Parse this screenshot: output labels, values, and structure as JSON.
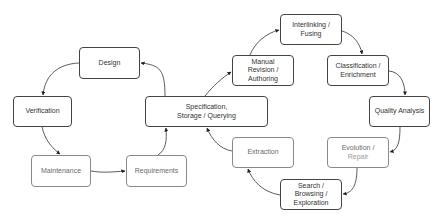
{
  "diagram": {
    "title": "",
    "colors": {
      "edge": "#333333",
      "node_border_dark": "#444444",
      "node_border_light": "#8a8a8a",
      "text_dark": "#333333",
      "text_light": "#6a6a6a",
      "text_faint": "#9a9a9a"
    },
    "nodes": [
      {
        "id": "design",
        "lines": [
          "Design"
        ],
        "style": "dark",
        "x": 79,
        "y": 47,
        "w": 61,
        "h": 32
      },
      {
        "id": "verification",
        "lines": [
          "Verification"
        ],
        "style": "dark",
        "x": 13,
        "y": 96,
        "w": 59,
        "h": 31
      },
      {
        "id": "maintenance",
        "lines": [
          "Maintenance"
        ],
        "style": "light",
        "x": 31,
        "y": 155,
        "w": 60,
        "h": 32
      },
      {
        "id": "requirements",
        "lines": [
          "Requirements"
        ],
        "style": "light",
        "x": 126,
        "y": 155,
        "w": 61,
        "h": 32
      },
      {
        "id": "specification",
        "lines": [
          "Specification,",
          "Storage / Querying"
        ],
        "style": "dark",
        "x": 145,
        "y": 96,
        "w": 123,
        "h": 31
      },
      {
        "id": "manual-revision",
        "lines": [
          "Manual",
          "Revision /",
          "Authoring"
        ],
        "style": "dark",
        "x": 232,
        "y": 55,
        "w": 62,
        "h": 31
      },
      {
        "id": "interlinking",
        "lines": [
          "Interlinking /",
          "Fusing"
        ],
        "style": "dark",
        "x": 280,
        "y": 14,
        "w": 62,
        "h": 31
      },
      {
        "id": "classification",
        "lines": [
          "Classification /",
          "Enrichment"
        ],
        "style": "dark",
        "x": 327,
        "y": 55,
        "w": 62,
        "h": 31
      },
      {
        "id": "quality-analysis",
        "lines": [
          "Quality Analysis"
        ],
        "style": "dark",
        "x": 369,
        "y": 96,
        "w": 61,
        "h": 31
      },
      {
        "id": "evolution",
        "lines": [
          "Evolution /",
          "Repair"
        ],
        "style": "light",
        "faint_lines": [
          1
        ],
        "x": 327,
        "y": 137,
        "w": 62,
        "h": 31
      },
      {
        "id": "search",
        "lines": [
          "Search /",
          "Browsing /",
          "Exploration"
        ],
        "style": "dark",
        "x": 280,
        "y": 179,
        "w": 62,
        "h": 31
      },
      {
        "id": "extraction",
        "lines": [
          "Extraction"
        ],
        "style": "light",
        "x": 232,
        "y": 137,
        "w": 62,
        "h": 31
      }
    ],
    "edges": [
      {
        "from": "specification",
        "to": "design",
        "path": "M165,96 C165,70 160,65 141,63"
      },
      {
        "from": "design",
        "to": "verification",
        "path": "M79,63 C58,64 45,75 43,95"
      },
      {
        "from": "verification",
        "to": "maintenance",
        "path": "M42,127 C45,140 52,148 60,154"
      },
      {
        "from": "maintenance",
        "to": "requirements",
        "path": "M91,171 C103,173 112,172 125,171"
      },
      {
        "from": "requirements",
        "to": "specification",
        "path": "M158,155 C166,150 167,140 166,128"
      },
      {
        "from": "specification",
        "to": "manual-revision",
        "path": "M205,96 C213,86 222,78 231,72"
      },
      {
        "from": "manual-revision",
        "to": "interlinking",
        "path": "M250,55 C255,42 267,33 279,30"
      },
      {
        "from": "interlinking",
        "to": "classification",
        "path": "M342,31 C352,34 360,42 362,54"
      },
      {
        "from": "classification",
        "to": "quality-analysis",
        "path": "M389,71 C400,72 405,82 405,95"
      },
      {
        "from": "quality-analysis",
        "to": "evolution",
        "path": "M400,127 C400,142 398,150 390,152"
      },
      {
        "from": "evolution",
        "to": "search",
        "path": "M357,168 C357,186 352,193 343,194"
      },
      {
        "from": "search",
        "to": "extraction",
        "path": "M280,195 C262,192 252,180 248,169"
      },
      {
        "from": "extraction",
        "to": "specification",
        "path": "M232,151 C220,149 212,140 207,128"
      }
    ]
  }
}
